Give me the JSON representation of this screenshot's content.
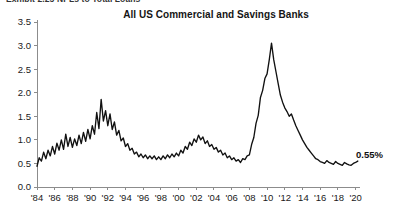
{
  "header": {
    "clipped_text": "Exhibit 2.25   NPLs to Total Loans"
  },
  "chart_data": {
    "type": "line",
    "title": "All US Commercial and Savings Banks",
    "subtitle": "",
    "xlabel": "",
    "ylabel": "",
    "ylim": [
      0.0,
      3.5
    ],
    "xlim": [
      1984.0,
      2020.5
    ],
    "grid": false,
    "legend": null,
    "y_ticks": [
      "0.0",
      "0.5",
      "1.0",
      "1.5",
      "2.0",
      "2.5",
      "3.0",
      "3.5"
    ],
    "y_tick_values": [
      0.0,
      0.5,
      1.0,
      1.5,
      2.0,
      2.5,
      3.0,
      3.5
    ],
    "x_ticks": [
      "'84",
      "'86",
      "'88",
      "'90",
      "'92",
      "'94",
      "'96",
      "'98",
      "'00",
      "'02",
      "'04",
      "'06",
      "'08",
      "'10",
      "'12",
      "'14",
      "'16",
      "'18",
      "'20"
    ],
    "x_tick_values": [
      1984,
      1986,
      1988,
      1990,
      1992,
      1994,
      1996,
      1998,
      2000,
      2002,
      2004,
      2006,
      2008,
      2010,
      2012,
      2014,
      2016,
      2018,
      2020
    ],
    "annotations": [
      {
        "text": "0.55%",
        "x": 2019.6,
        "y": 0.62,
        "name": "last-value-label"
      }
    ],
    "series": [
      {
        "name": "NPL ratio",
        "color": "#111111",
        "x": [
          1984.0,
          1984.25,
          1984.5,
          1984.75,
          1985.0,
          1985.25,
          1985.5,
          1985.75,
          1986.0,
          1986.25,
          1986.5,
          1986.75,
          1987.0,
          1987.25,
          1987.5,
          1987.75,
          1988.0,
          1988.25,
          1988.5,
          1988.75,
          1989.0,
          1989.25,
          1989.5,
          1989.75,
          1990.0,
          1990.25,
          1990.5,
          1990.75,
          1991.0,
          1991.25,
          1991.5,
          1991.75,
          1992.0,
          1992.25,
          1992.5,
          1992.75,
          1993.0,
          1993.25,
          1993.5,
          1993.75,
          1994.0,
          1994.25,
          1994.5,
          1994.75,
          1995.0,
          1995.25,
          1995.5,
          1995.75,
          1996.0,
          1996.25,
          1996.5,
          1996.75,
          1997.0,
          1997.25,
          1997.5,
          1997.75,
          1998.0,
          1998.25,
          1998.5,
          1998.75,
          1999.0,
          1999.25,
          1999.5,
          1999.75,
          2000.0,
          2000.25,
          2000.5,
          2000.75,
          2001.0,
          2001.25,
          2001.5,
          2001.75,
          2002.0,
          2002.25,
          2002.5,
          2002.75,
          2003.0,
          2003.25,
          2003.5,
          2003.75,
          2004.0,
          2004.25,
          2004.5,
          2004.75,
          2005.0,
          2005.25,
          2005.5,
          2005.75,
          2006.0,
          2006.25,
          2006.5,
          2006.75,
          2007.0,
          2007.25,
          2007.5,
          2007.75,
          2008.0,
          2008.25,
          2008.5,
          2008.75,
          2009.0,
          2009.25,
          2009.5,
          2009.75,
          2010.0,
          2010.25,
          2010.5,
          2010.75,
          2011.0,
          2011.25,
          2011.5,
          2011.75,
          2012.0,
          2012.25,
          2012.5,
          2012.75,
          2013.0,
          2013.25,
          2013.5,
          2013.75,
          2014.0,
          2014.25,
          2014.5,
          2014.75,
          2015.0,
          2015.25,
          2015.5,
          2015.75,
          2016.0,
          2016.25,
          2016.5,
          2016.75,
          2017.0,
          2017.25,
          2017.5,
          2017.75,
          2018.0,
          2018.25,
          2018.5,
          2018.75,
          2019.0,
          2019.25,
          2019.5,
          2019.75,
          2020.0,
          2020.25
        ],
        "y": [
          0.44,
          0.62,
          0.55,
          0.74,
          0.6,
          0.78,
          0.66,
          0.86,
          0.7,
          0.93,
          0.78,
          1.0,
          0.8,
          1.12,
          0.86,
          1.05,
          0.84,
          1.02,
          0.88,
          1.1,
          0.92,
          1.16,
          0.97,
          1.22,
          1.02,
          1.3,
          1.12,
          1.58,
          1.24,
          1.86,
          1.4,
          1.62,
          1.3,
          1.55,
          1.22,
          1.38,
          1.1,
          1.2,
          0.98,
          1.04,
          0.86,
          0.92,
          0.78,
          0.82,
          0.7,
          0.74,
          0.64,
          0.7,
          0.62,
          0.68,
          0.6,
          0.66,
          0.6,
          0.66,
          0.58,
          0.64,
          0.58,
          0.66,
          0.6,
          0.68,
          0.62,
          0.7,
          0.64,
          0.72,
          0.66,
          0.78,
          0.72,
          0.86,
          0.8,
          0.95,
          0.88,
          1.02,
          0.95,
          1.1,
          1.0,
          1.06,
          0.92,
          0.98,
          0.86,
          0.9,
          0.8,
          0.84,
          0.74,
          0.78,
          0.68,
          0.72,
          0.62,
          0.66,
          0.58,
          0.62,
          0.55,
          0.58,
          0.52,
          0.6,
          0.58,
          0.66,
          0.68,
          0.9,
          1.05,
          1.35,
          1.52,
          1.9,
          2.05,
          2.3,
          2.4,
          2.7,
          3.05,
          2.7,
          2.45,
          2.2,
          1.95,
          1.8,
          1.68,
          1.6,
          1.5,
          1.55,
          1.42,
          1.3,
          1.2,
          1.1,
          1.0,
          0.92,
          0.84,
          0.78,
          0.72,
          0.66,
          0.6,
          0.58,
          0.54,
          0.52,
          0.5,
          0.56,
          0.52,
          0.5,
          0.48,
          0.54,
          0.5,
          0.48,
          0.46,
          0.52,
          0.49,
          0.47,
          0.46,
          0.5,
          0.52,
          0.55
        ]
      }
    ]
  }
}
